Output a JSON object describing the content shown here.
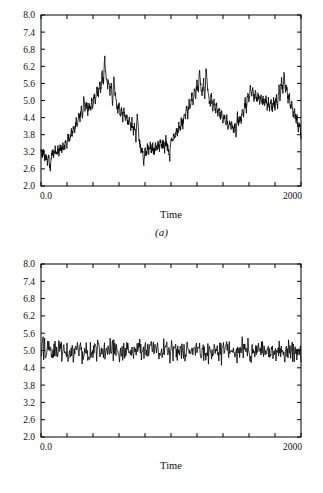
{
  "figure": {
    "background_color": "#ffffff",
    "line_color": "#000000",
    "axis_color": "#000000"
  },
  "panels": [
    {
      "id": "a",
      "caption": "(a)",
      "xlabel": "Time",
      "x_tick_labels": [
        "0.0",
        "2000"
      ],
      "y_tick_labels": [
        "8.0",
        "7.4",
        "6.8",
        "6.2",
        "5.6",
        "5.0",
        "4.4",
        "3.8",
        "3.2",
        "2.6",
        "2.0"
      ]
    },
    {
      "id": "b",
      "caption": "(b)",
      "xlabel": "Time",
      "x_tick_labels": [
        "0.0",
        "2000"
      ],
      "y_tick_labels": [
        "8.0",
        "7.4",
        "6.8",
        "6.2",
        "5.6",
        "5.0",
        "4.4",
        "3.8",
        "3.2",
        "2.6",
        "2.0"
      ]
    }
  ],
  "chart_data": [
    {
      "type": "line",
      "panel": "a",
      "title": "",
      "subtitle": "",
      "xlabel": "Time",
      "ylabel": "",
      "caption": "(a)",
      "xlim": [
        0,
        2000
      ],
      "ylim": [
        2.0,
        8.0
      ],
      "xticks": [
        0,
        200,
        400,
        600,
        800,
        1000,
        1200,
        1400,
        1600,
        1800,
        2000
      ],
      "xtick_labels": [
        "0.0",
        "",
        "",
        "",
        "",
        "",
        "",
        "",
        "",
        "",
        "2000"
      ],
      "yticks": [
        2.0,
        2.6,
        3.2,
        3.8,
        4.4,
        5.0,
        5.6,
        6.2,
        6.8,
        7.4,
        8.0
      ],
      "ytick_labels": [
        "2.0",
        "2.6",
        "3.2",
        "3.8",
        "4.4",
        "5.0",
        "5.6",
        "6.2",
        "6.8",
        "7.4",
        "8.0"
      ],
      "grid": false,
      "legend": false,
      "legend_position": "none",
      "description": "Non-stationary / strongly autocorrelated series wandering between about 2.1 and 6.5 with long slow excursions",
      "series": [
        {
          "name": "series-a",
          "color": "#000000",
          "x": [
            0,
            10,
            20,
            30,
            40,
            50,
            60,
            70,
            80,
            90,
            100,
            110,
            120,
            130,
            140,
            150,
            160,
            170,
            180,
            190,
            200,
            210,
            220,
            230,
            240,
            250,
            260,
            270,
            280,
            290,
            300,
            310,
            320,
            330,
            340,
            350,
            360,
            370,
            380,
            390,
            400,
            410,
            420,
            430,
            440,
            450,
            460,
            470,
            480,
            490,
            500,
            510,
            520,
            530,
            540,
            550,
            560,
            570,
            580,
            590,
            600,
            610,
            620,
            630,
            640,
            650,
            660,
            670,
            680,
            690,
            700,
            710,
            720,
            730,
            740,
            750,
            760,
            770,
            780,
            790,
            800,
            810,
            820,
            830,
            840,
            850,
            860,
            870,
            880,
            890,
            900,
            910,
            920,
            930,
            940,
            950,
            960,
            970,
            980,
            990,
            1000,
            1010,
            1020,
            1030,
            1040,
            1050,
            1060,
            1070,
            1080,
            1090,
            1100,
            1110,
            1120,
            1130,
            1140,
            1150,
            1160,
            1170,
            1180,
            1190,
            1200,
            1210,
            1220,
            1230,
            1240,
            1250,
            1260,
            1270,
            1280,
            1290,
            1300,
            1310,
            1320,
            1330,
            1340,
            1350,
            1360,
            1370,
            1380,
            1390,
            1400,
            1410,
            1420,
            1430,
            1440,
            1450,
            1460,
            1470,
            1480,
            1490,
            1500,
            1510,
            1520,
            1530,
            1540,
            1550,
            1560,
            1570,
            1580,
            1590,
            1600,
            1610,
            1620,
            1630,
            1640,
            1650,
            1660,
            1670,
            1680,
            1690,
            1700,
            1710,
            1720,
            1730,
            1740,
            1750,
            1760,
            1770,
            1780,
            1790,
            1800,
            1810,
            1820,
            1830,
            1840,
            1850,
            1860,
            1870,
            1880,
            1890,
            1900,
            1910,
            1920,
            1930,
            1940,
            1950,
            1960,
            1970,
            1980,
            1990,
            2000
          ],
          "y": [
            3.35,
            3.05,
            3.25,
            2.95,
            3.15,
            2.75,
            3.05,
            2.6,
            3.0,
            3.2,
            3.1,
            3.3,
            3.05,
            3.3,
            3.15,
            3.4,
            3.2,
            3.45,
            3.3,
            3.6,
            3.45,
            3.8,
            3.55,
            3.95,
            3.7,
            4.15,
            3.9,
            4.35,
            4.1,
            4.6,
            4.3,
            4.75,
            4.45,
            5.05,
            4.7,
            4.95,
            4.55,
            4.85,
            4.6,
            5.0,
            4.75,
            5.2,
            4.9,
            5.5,
            5.15,
            5.7,
            5.35,
            6.0,
            5.6,
            6.5,
            5.85,
            5.45,
            5.75,
            5.2,
            5.6,
            4.85,
            5.9,
            5.25,
            4.95,
            4.6,
            4.9,
            4.5,
            4.75,
            4.35,
            4.65,
            4.3,
            4.5,
            4.1,
            4.4,
            4.0,
            4.3,
            3.85,
            4.15,
            3.6,
            4.45,
            3.9,
            3.5,
            3.2,
            3.45,
            2.65,
            3.25,
            3.1,
            3.4,
            3.2,
            3.5,
            3.25,
            3.4,
            3.15,
            3.45,
            3.3,
            3.5,
            3.3,
            3.6,
            3.35,
            3.55,
            3.2,
            3.7,
            3.4,
            3.3,
            2.95,
            3.6,
            3.45,
            3.85,
            3.6,
            4.0,
            3.75,
            4.2,
            3.95,
            4.35,
            4.1,
            4.55,
            4.3,
            4.75,
            4.45,
            4.95,
            4.65,
            5.2,
            4.85,
            5.45,
            5.1,
            5.7,
            5.3,
            6.15,
            5.5,
            5.2,
            5.7,
            5.15,
            6.1,
            5.55,
            5.05,
            4.85,
            5.15,
            4.7,
            5.0,
            4.6,
            4.85,
            4.5,
            4.75,
            4.4,
            4.6,
            4.25,
            4.5,
            4.15,
            4.4,
            4.05,
            4.3,
            3.95,
            4.25,
            3.85,
            4.15,
            3.8,
            4.5,
            4.15,
            4.45,
            4.3,
            4.75,
            4.5,
            5.0,
            4.7,
            5.3,
            4.95,
            5.6,
            5.2,
            5.4,
            5.0,
            5.3,
            4.95,
            5.25,
            4.9,
            5.15,
            4.85,
            5.1,
            4.8,
            5.05,
            4.75,
            5.0,
            4.7,
            4.95,
            4.65,
            5.0,
            4.75,
            5.15,
            4.85,
            5.45,
            5.05,
            5.8,
            5.2,
            6.05,
            5.35,
            5.5,
            5.0,
            5.2,
            4.7,
            4.95,
            4.45,
            4.7,
            4.25,
            4.45,
            3.95,
            4.25,
            3.75,
            4.05,
            3.6,
            3.85,
            3.4,
            3.7,
            3.25,
            3.55,
            3.1,
            2.85,
            3.15,
            3.4,
            3.2,
            3.55,
            3.3,
            3.7,
            3.45,
            3.85,
            3.55,
            3.95,
            3.6,
            3.8,
            3.5,
            3.95,
            3.6,
            3.75,
            3.45,
            3.65,
            3.35,
            3.55,
            3.3,
            3.5,
            3.2,
            3.45,
            3.15,
            3.35,
            3.0,
            3.25,
            2.85,
            3.1,
            2.7,
            3.0,
            2.55,
            2.85,
            2.4,
            2.7,
            2.3,
            2.6,
            2.15,
            2.5,
            2.35,
            2.75,
            2.6,
            3.0,
            2.85,
            3.25,
            3.1,
            3.5,
            3.3,
            3.7,
            3.5,
            3.95,
            3.7,
            4.2,
            3.95,
            4.5,
            4.2,
            4.8,
            4.5,
            5.15,
            4.8,
            5.55,
            5.2,
            6.0,
            5.4,
            5.1,
            5.4,
            4.95,
            5.25,
            4.65,
            5.45,
            5.75,
            5.3,
            5.0,
            4.6,
            4.85,
            4.45,
            4.7,
            4.35,
            4.65,
            4.45,
            4.8,
            4.5,
            4.85,
            4.6,
            4.9,
            4.65,
            4.95,
            4.7,
            5.0,
            4.75,
            5.1,
            4.85,
            5.15,
            4.9,
            4.75,
            5.05,
            4.85,
            5.15,
            5.0
          ]
        }
      ]
    },
    {
      "type": "line",
      "panel": "b",
      "title": "",
      "subtitle": "",
      "xlabel": "Time",
      "ylabel": "",
      "caption": "(b)",
      "xlim": [
        0,
        2000
      ],
      "ylim": [
        2.0,
        8.0
      ],
      "xticks": [
        0,
        200,
        400,
        600,
        800,
        1000,
        1200,
        1400,
        1600,
        1800,
        2000
      ],
      "xtick_labels": [
        "0.0",
        "",
        "",
        "",
        "",
        "",
        "",
        "",
        "",
        "",
        "2000"
      ],
      "yticks": [
        2.0,
        2.6,
        3.2,
        3.8,
        4.4,
        5.0,
        5.6,
        6.2,
        6.8,
        7.4,
        8.0
      ],
      "ytick_labels": [
        "2.0",
        "2.6",
        "3.2",
        "3.8",
        "4.4",
        "5.0",
        "5.6",
        "6.2",
        "6.8",
        "7.4",
        "8.0"
      ],
      "grid": false,
      "legend": false,
      "legend_position": "none",
      "description": "Stationary white-noise series tightly centred on 5.0, confined to roughly 4.35-5.65",
      "mean": 5.0,
      "approx_min": 4.35,
      "approx_max": 5.65,
      "series": [
        {
          "name": "series-b",
          "color": "#000000",
          "noise_center": 5.0,
          "noise_amplitude": 0.62,
          "n_points": 500
        }
      ]
    }
  ]
}
